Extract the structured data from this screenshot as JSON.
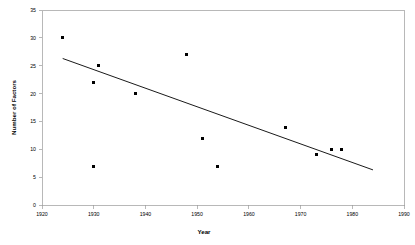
{
  "chart_data": {
    "type": "scatter",
    "title": "",
    "xlabel": "Year",
    "ylabel": "Number of Factors",
    "xlim": [
      1920,
      1990
    ],
    "ylim": [
      0,
      35
    ],
    "xticks": [
      1920,
      1930,
      1940,
      1950,
      1960,
      1970,
      1980,
      1990
    ],
    "yticks": [
      0,
      5,
      10,
      15,
      20,
      25,
      30,
      35
    ],
    "xtick_labels": [
      "1920",
      "1930",
      "1940",
      "1950",
      "1960",
      "1970",
      "1980",
      "1990"
    ],
    "ytick_labels": [
      "0",
      "5",
      "10",
      "15",
      "20",
      "25",
      "30",
      "35"
    ],
    "grid": false,
    "legend": false,
    "legend_position": "none",
    "marker": "square",
    "marker_color": "#000000",
    "series": [
      {
        "name": "Number of Factors",
        "x": [
          1924,
          1930,
          1931,
          1938,
          1948,
          1951,
          1954,
          1967,
          1973,
          1976,
          1978
        ],
        "y": [
          30,
          22,
          25,
          20,
          27,
          12,
          7,
          14,
          9,
          10,
          10
        ],
        "points": [
          {
            "x": 1924,
            "y": 30
          },
          {
            "x": 1930,
            "y": 22
          },
          {
            "x": 1931,
            "y": 25
          },
          {
            "x": 1938,
            "y": 20
          },
          {
            "x": 1948,
            "y": 27
          },
          {
            "x": 1951,
            "y": 12
          },
          {
            "x": 1954,
            "y": 7
          },
          {
            "x": 1967,
            "y": 14
          },
          {
            "x": 1973,
            "y": 9
          },
          {
            "x": 1976,
            "y": 10
          },
          {
            "x": 1978,
            "y": 10
          }
        ]
      }
    ],
    "extra_point": {
      "x": 1930,
      "y": 7,
      "note": "low outlier near 1930"
    },
    "trendline": {
      "type": "linear",
      "x_start": 1924,
      "y_start": 26.3,
      "x_end": 1984,
      "y_end": 6.3,
      "color": "#1a1a1a"
    }
  },
  "axes": {
    "x_title": "Year",
    "y_title": "Number of Factors"
  }
}
